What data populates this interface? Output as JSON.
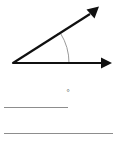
{
  "figure": {
    "name": "angle-diagram",
    "vertex": {
      "x": 13,
      "y": 63
    },
    "rays": [
      {
        "name": "horizontal-ray",
        "from": {
          "x": 13,
          "y": 63
        },
        "to": {
          "x": 111,
          "y": 63
        },
        "arrowhead": "end",
        "color": "#101010"
      },
      {
        "name": "upper-ray",
        "from": {
          "x": 13,
          "y": 63
        },
        "to": {
          "x": 98,
          "y": 9
        },
        "arrowhead": "end",
        "color": "#101010"
      }
    ],
    "arc": {
      "name": "angle-arc",
      "center": {
        "x": 13,
        "y": 63
      },
      "radius": 56,
      "start_angle_deg": 32,
      "end_angle_deg": 0,
      "color": "#9a9a9a"
    },
    "tick": {
      "name": "angle-tick-mark",
      "on_ray": "upper-ray",
      "x": 56,
      "y": 36,
      "color": "#4a4a4a"
    },
    "measure_deg": 32
  },
  "labels": {
    "degree_symbol": "°"
  },
  "answer_lines": [
    {
      "name": "answer-line-1",
      "x": 4,
      "y": 107,
      "length": 64,
      "color": "#8d8d8d"
    },
    {
      "name": "answer-line-2",
      "x": 4,
      "y": 133,
      "length": 109,
      "color": "#8d8d8d"
    }
  ],
  "colors": {
    "background": "#ffffff",
    "ray_stroke": "#101010",
    "arc_stroke": "#9a9a9a",
    "rule_stroke": "#8d8d8d",
    "text": "#4a4a4a"
  }
}
